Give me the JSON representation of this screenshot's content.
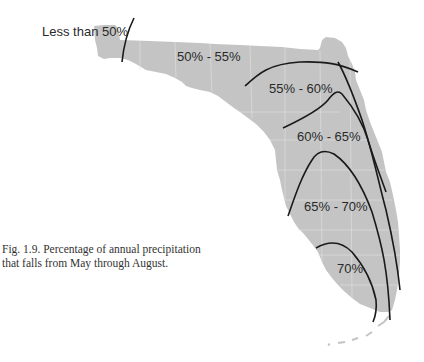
{
  "map": {
    "title": "Percentage of annual precipitation that falls from May through August",
    "region": "Florida",
    "land_color": "#c4c4c4",
    "county_line_color": "#e6e6e6",
    "contour_color": "#1a1a1a",
    "zones": [
      {
        "label": "Less than 50%"
      },
      {
        "label": "50% - 55%"
      },
      {
        "label": "55% - 60%"
      },
      {
        "label": "60% - 65%"
      },
      {
        "label": "65% - 70%"
      },
      {
        "label": "70%"
      }
    ]
  },
  "caption": {
    "line1": "Fig. 1.9. Percentage of annual precipitation",
    "line2": "that falls from May through August."
  }
}
